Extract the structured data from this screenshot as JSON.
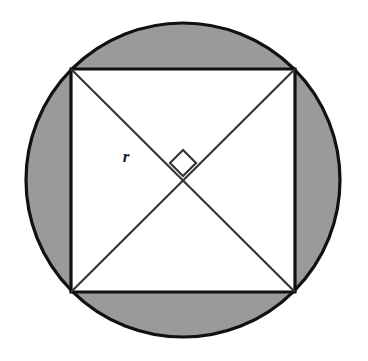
{
  "figure": {
    "background_color": "#ffffff"
  },
  "labels": {
    "radius": "r"
  },
  "colors": {
    "shaded_region": "#9a9a9a",
    "inner_region": "#ffffff",
    "stroke": "#111111",
    "diagonal_stroke": "#333333",
    "label_color": "#1a1a1a"
  },
  "geometry": {
    "circle": {
      "name": "outer-circle",
      "center_x": 183,
      "center_y": 180,
      "radius": 157,
      "stroke_width": 3.2
    },
    "square": {
      "name": "inscribed-square",
      "corners": [
        {
          "name": "top-left",
          "x": 71,
          "y": 69
        },
        {
          "name": "top-right",
          "x": 295,
          "y": 69
        },
        {
          "name": "bottom-right",
          "x": 295,
          "y": 292
        },
        {
          "name": "bottom-left",
          "x": 71,
          "y": 292
        }
      ],
      "side_length": 224,
      "stroke_width": 3.2
    },
    "diagonals": [
      {
        "name": "diagonal-tl-br",
        "x1": 71,
        "y1": 69,
        "x2": 295,
        "y2": 292
      },
      {
        "name": "diagonal-tr-bl",
        "x1": 295,
        "y1": 69,
        "x2": 71,
        "y2": 292
      }
    ],
    "diagonal_stroke_width": 2.1,
    "right_angle_marker": {
      "name": "right-angle-marker",
      "center_x": 183,
      "center_y": 163,
      "half_size": 13,
      "stroke_width": 2.1
    },
    "radius_label_position": {
      "x": 126,
      "y": 158
    }
  }
}
